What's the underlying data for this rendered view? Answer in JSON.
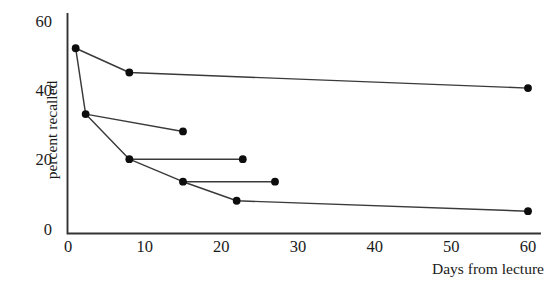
{
  "chart_data": {
    "type": "line",
    "title": "",
    "xlabel": "Days from lecture",
    "ylabel": "percent recalled",
    "xlim": [
      0,
      62
    ],
    "ylim": [
      0,
      62
    ],
    "xticks": [
      0,
      10,
      20,
      30,
      40,
      50,
      60
    ],
    "xtick_labels": [
      "0",
      "10",
      "20",
      "30",
      "40",
      "50",
      "60"
    ],
    "yticks": [
      0,
      20,
      40,
      60
    ],
    "ytick_labels": [
      "0",
      "20",
      "40",
      "60"
    ],
    "grid": false,
    "legend": "none",
    "marker": "filled-circle",
    "series": [
      {
        "name": "segment-1",
        "points": [
          {
            "x": 1,
            "y": 52
          },
          {
            "x": 8,
            "y": 45
          },
          {
            "x": 60,
            "y": 40.5
          }
        ]
      },
      {
        "name": "segment-2",
        "points": [
          {
            "x": 1,
            "y": 52
          },
          {
            "x": 2.3,
            "y": 33
          },
          {
            "x": 15,
            "y": 28
          }
        ]
      },
      {
        "name": "segment-3",
        "points": [
          {
            "x": 2.3,
            "y": 33
          },
          {
            "x": 8,
            "y": 20
          },
          {
            "x": 22.8,
            "y": 20
          }
        ]
      },
      {
        "name": "segment-4",
        "points": [
          {
            "x": 8,
            "y": 20
          },
          {
            "x": 15,
            "y": 13.5
          },
          {
            "x": 27,
            "y": 13.5
          }
        ]
      },
      {
        "name": "segment-5",
        "points": [
          {
            "x": 15,
            "y": 13.5
          },
          {
            "x": 22,
            "y": 8
          },
          {
            "x": 60,
            "y": 5
          }
        ]
      }
    ],
    "all_points": [
      {
        "x": 1,
        "y": 52
      },
      {
        "x": 8,
        "y": 45
      },
      {
        "x": 60,
        "y": 40.5
      },
      {
        "x": 2.3,
        "y": 33
      },
      {
        "x": 15,
        "y": 28
      },
      {
        "x": 8,
        "y": 20
      },
      {
        "x": 22.8,
        "y": 20
      },
      {
        "x": 15,
        "y": 13.5
      },
      {
        "x": 27,
        "y": 13.5
      },
      {
        "x": 22,
        "y": 8
      },
      {
        "x": 60,
        "y": 5
      }
    ],
    "colors": {
      "line": "#3a3a3a",
      "marker": "#0d0d0d",
      "axis": "#333333",
      "background": "#ffffff"
    }
  }
}
